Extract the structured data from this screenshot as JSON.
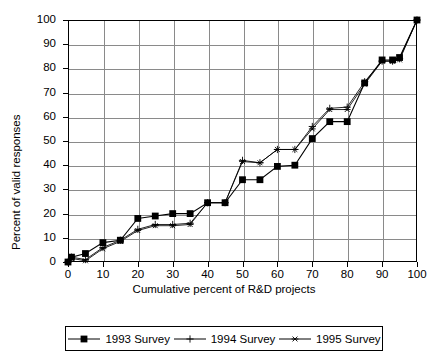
{
  "chart_data": {
    "type": "line",
    "title": "",
    "subtitle": "",
    "xlabel": "Cumulative percent of R&D projects",
    "ylabel": "Percent of valid responses",
    "xlim": [
      0,
      100
    ],
    "ylim": [
      0,
      100
    ],
    "xticks": [
      0,
      10,
      20,
      30,
      40,
      50,
      60,
      70,
      80,
      90,
      100
    ],
    "yticks": [
      0,
      10,
      20,
      30,
      40,
      50,
      60,
      70,
      80,
      90,
      100
    ],
    "xtick_labels": [
      "0",
      "10",
      "20",
      "30",
      "40",
      "50",
      "60",
      "70",
      "80",
      "90",
      "100"
    ],
    "ytick_labels": [
      "0",
      "10",
      "20",
      "30",
      "40",
      "50",
      "60",
      "70",
      "80",
      "90",
      "100"
    ],
    "grid": true,
    "grid_color": "#8a8a8a",
    "legend_position": "bottom",
    "series": [
      {
        "name": "1993 Survey",
        "marker": "filled-square",
        "color": "#000000",
        "x": [
          0,
          1,
          5,
          10,
          15,
          20,
          25,
          30,
          35,
          40,
          45,
          50,
          55,
          60,
          65,
          70,
          75,
          80,
          85,
          90,
          93,
          95,
          100
        ],
        "y": [
          0,
          2,
          3.5,
          8,
          9,
          18,
          19,
          20,
          20,
          24.5,
          24.5,
          34,
          34,
          39.5,
          40,
          51,
          58,
          58,
          74,
          83.5,
          83.5,
          84.5,
          100
        ]
      },
      {
        "name": "1994 Survey",
        "marker": "plus",
        "color": "#000000",
        "x": [
          0,
          1,
          5,
          10,
          15,
          20,
          25,
          30,
          35,
          40,
          45,
          50,
          55,
          60,
          65,
          70,
          75,
          80,
          85,
          90,
          93,
          95,
          100
        ],
        "y": [
          0,
          2,
          1,
          6,
          9,
          13.5,
          15.5,
          15.5,
          16,
          24.5,
          24.5,
          42,
          41,
          46.5,
          46.5,
          56,
          63.5,
          64,
          74.5,
          83,
          83,
          84,
          100
        ]
      },
      {
        "name": "1995 Survey",
        "marker": "asterisk",
        "color": "#000000",
        "x": [
          0,
          1,
          5,
          10,
          15,
          20,
          25,
          30,
          35,
          40,
          45,
          50,
          55,
          60,
          65,
          70,
          75,
          80,
          85,
          90,
          93,
          95,
          100
        ],
        "y": [
          0,
          1.5,
          0.5,
          5.5,
          8.5,
          13,
          15,
          15,
          15.5,
          24.5,
          24.5,
          41.5,
          41,
          46.5,
          46.5,
          55,
          63,
          63,
          73.5,
          83,
          83,
          83.5,
          100
        ]
      }
    ]
  },
  "legend": {
    "items": [
      {
        "label": "1993 Survey",
        "marker": "filled-square"
      },
      {
        "label": "1994 Survey",
        "marker": "plus"
      },
      {
        "label": "1995 Survey",
        "marker": "asterisk"
      }
    ]
  }
}
